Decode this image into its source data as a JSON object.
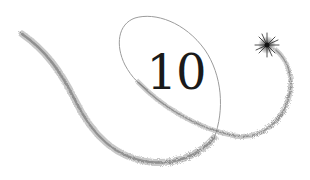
{
  "graphic": {
    "numeral": "10",
    "decoration": [
      "sparkle-trail-left",
      "ellipse-loop",
      "sparkle-trail-right",
      "star-icon"
    ],
    "colors": {
      "background": "#ffffff",
      "numeral": "#1a1a1a",
      "trail": "#8a8a8a",
      "trail_dark": "#555555",
      "star": "#333333"
    }
  }
}
